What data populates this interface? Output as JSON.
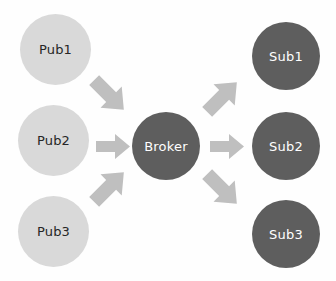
{
  "diagram": {
    "background_color": "#fefefe",
    "publisher_color": "#d9d9d9",
    "publisher_text_color": "#262626",
    "broker_color": "#5e5e5e",
    "broker_text_color": "#ffffff",
    "subscriber_color": "#5e5e5e",
    "subscriber_text_color": "#ffffff",
    "arrow_color": "#bfbfbf",
    "publishers": [
      {
        "id": "pub1",
        "label": "Pub1"
      },
      {
        "id": "pub2",
        "label": "Pub2"
      },
      {
        "id": "pub3",
        "label": "Pub3"
      }
    ],
    "broker": {
      "id": "broker",
      "label": "Broker"
    },
    "subscribers": [
      {
        "id": "sub1",
        "label": "Sub1"
      },
      {
        "id": "sub2",
        "label": "Sub2"
      },
      {
        "id": "sub3",
        "label": "Sub3"
      }
    ],
    "connections": [
      {
        "id": "pub1-broker",
        "from": "Pub1",
        "to": "Broker",
        "direction": "down-right"
      },
      {
        "id": "pub2-broker",
        "from": "Pub2",
        "to": "Broker",
        "direction": "right"
      },
      {
        "id": "pub3-broker",
        "from": "Pub3",
        "to": "Broker",
        "direction": "up-right"
      },
      {
        "id": "broker-sub1",
        "from": "Broker",
        "to": "Sub1",
        "direction": "up-right"
      },
      {
        "id": "broker-sub2",
        "from": "Broker",
        "to": "Sub2",
        "direction": "right"
      },
      {
        "id": "broker-sub3",
        "from": "Broker",
        "to": "Sub3",
        "direction": "down-right"
      }
    ]
  }
}
